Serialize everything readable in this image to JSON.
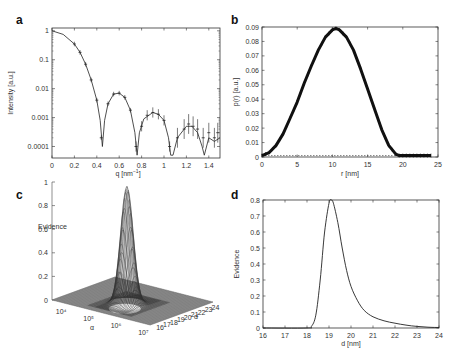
{
  "chart_data": [
    {
      "panel": "a",
      "type": "line",
      "xlabel": "q [nm⁻¹]",
      "ylabel": "Intensity [a.u.]",
      "xlim": [
        0,
        1.5
      ],
      "ylim_log": [
        5e-05,
        1.2
      ],
      "yscale": "log",
      "xticks": [
        "0",
        "0.2",
        "0.4",
        "0.6",
        "0.8",
        "1",
        "1.2",
        "1.4"
      ],
      "yticks": [
        "1",
        "0.1",
        "0.01",
        "0.001",
        "0.0001"
      ],
      "series": [
        {
          "name": "fit",
          "style": "line",
          "x": [
            0,
            0.1,
            0.2,
            0.25,
            0.3,
            0.35,
            0.4,
            0.43,
            0.45,
            0.47,
            0.5,
            0.55,
            0.6,
            0.65,
            0.7,
            0.74,
            0.76,
            0.78,
            0.82,
            0.9,
            0.95,
            1.0,
            1.04,
            1.06,
            1.08,
            1.12,
            1.2,
            1.25,
            1.3,
            1.34,
            1.36,
            1.4,
            1.45,
            1.5
          ],
          "y": [
            1,
            0.75,
            0.35,
            0.18,
            0.07,
            0.02,
            0.004,
            0.0008,
            0.0001,
            0.0008,
            0.003,
            0.0065,
            0.007,
            0.005,
            0.0018,
            0.0003,
            5e-05,
            0.0003,
            0.0009,
            0.0015,
            0.0013,
            0.0008,
            0.0002,
            5e-05,
            5e-05,
            0.0002,
            0.0005,
            0.0005,
            0.0003,
            0.0001,
            5e-05,
            0.0002,
            0.00015,
            0.0002
          ]
        },
        {
          "name": "data",
          "style": "error-bar markers",
          "x": [
            0.2,
            0.25,
            0.3,
            0.35,
            0.4,
            0.44,
            0.5,
            0.55,
            0.6,
            0.65,
            0.7,
            0.75,
            0.8,
            0.85,
            0.9,
            0.95,
            1.0,
            1.05,
            1.12,
            1.18,
            1.22,
            1.26,
            1.3,
            1.35,
            1.4,
            1.45,
            1.48
          ],
          "y": [
            0.35,
            0.18,
            0.07,
            0.02,
            0.004,
            0.0002,
            0.003,
            0.0065,
            0.007,
            0.005,
            0.0018,
            0.0001,
            0.0005,
            0.0012,
            0.0015,
            0.0013,
            0.0008,
            0.0001,
            0.0002,
            0.0004,
            0.0006,
            0.0005,
            0.0004,
            0.0002,
            0.0003,
            0.0002,
            0.0003
          ]
        }
      ]
    },
    {
      "panel": "b",
      "type": "line",
      "xlabel": "r [nm]",
      "ylabel": "p(r) [a.u.]",
      "xlim": [
        0,
        25
      ],
      "ylim": [
        0,
        0.09
      ],
      "xticks": [
        "0",
        "5",
        "10",
        "15",
        "20",
        "25"
      ],
      "yticks": [
        "0",
        "0.01",
        "0.02",
        "0.03",
        "0.04",
        "0.05",
        "0.06",
        "0.07",
        "0.08",
        "0.09"
      ],
      "series": [
        {
          "name": "p(r)",
          "style": "thick marker line",
          "x": [
            0,
            1,
            2,
            3,
            4,
            5,
            6,
            7,
            8,
            9,
            10,
            10.5,
            11,
            12,
            13,
            14,
            15,
            16,
            17,
            18,
            19,
            19.5,
            20,
            21,
            22,
            23,
            24
          ],
          "y": [
            0.001,
            0.003,
            0.008,
            0.016,
            0.027,
            0.038,
            0.051,
            0.063,
            0.074,
            0.083,
            0.088,
            0.089,
            0.088,
            0.083,
            0.074,
            0.061,
            0.047,
            0.033,
            0.019,
            0.008,
            0.002,
            0.001,
            0.001,
            0.001,
            0.001,
            0.001,
            0.001
          ]
        },
        {
          "name": "baseline",
          "style": "dashed",
          "x": [
            0,
            24
          ],
          "y": [
            0.001,
            0.001
          ]
        }
      ]
    },
    {
      "panel": "c",
      "type": "surface3d",
      "zlabel": "Evidence",
      "xlabel": "α",
      "ylabel": "d",
      "zticks": [
        "0",
        "0.2",
        "0.4",
        "0.6",
        "0.8",
        "1"
      ],
      "xticks": [
        "10⁴",
        "10⁵",
        "10⁶",
        "10⁷"
      ],
      "yticks": [
        "16",
        "17",
        "18",
        "19",
        "20",
        "21",
        "22",
        "23",
        "24"
      ],
      "peak": {
        "alpha": "~10^5.5",
        "d": 19.1,
        "evidence": 1.0
      }
    },
    {
      "panel": "d",
      "type": "line",
      "xlabel": "d [nm]",
      "ylabel": "Evidence",
      "xlim": [
        16,
        24
      ],
      "ylim": [
        0,
        0.8
      ],
      "xticks": [
        "16",
        "17",
        "18",
        "19",
        "20",
        "21",
        "22",
        "23",
        "24"
      ],
      "yticks": [
        "0",
        "0.1",
        "0.2",
        "0.3",
        "0.4",
        "0.5",
        "0.6",
        "0.7",
        "0.8"
      ],
      "series": [
        {
          "name": "evidence",
          "x": [
            16,
            18,
            18.2,
            18.4,
            18.6,
            18.8,
            19.0,
            19.1,
            19.2,
            19.4,
            19.6,
            19.8,
            20.0,
            20.3,
            20.6,
            21.0,
            21.5,
            22.0,
            22.5,
            23.0,
            23.5,
            24.0
          ],
          "y": [
            0,
            0,
            0.01,
            0.08,
            0.3,
            0.6,
            0.78,
            0.8,
            0.78,
            0.66,
            0.5,
            0.36,
            0.26,
            0.17,
            0.11,
            0.07,
            0.045,
            0.03,
            0.018,
            0.01,
            0.005,
            0.003
          ]
        }
      ]
    }
  ],
  "panels": {
    "a": {
      "letter": "a",
      "xlabel": "q [nm",
      "xlabel_sup": "−1",
      "xlabel_end": "]",
      "ylabel": "Intensity [a.u.]"
    },
    "b": {
      "letter": "b",
      "xlabel": "r [nm]",
      "ylabel": "p(r)  [a.u.]"
    },
    "c": {
      "letter": "c",
      "zlabel": "Evidence",
      "xlabel": "α",
      "ylabel": "d"
    },
    "d": {
      "letter": "d",
      "xlabel": "d [nm]",
      "ylabel": "Evidence"
    }
  }
}
